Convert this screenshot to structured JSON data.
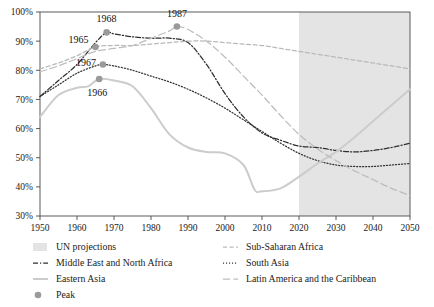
{
  "chart_data": {
    "type": "line",
    "title": "",
    "subtitle": "",
    "xlabel": "",
    "ylabel": "",
    "xlim": [
      1950,
      2050
    ],
    "ylim": [
      30,
      100
    ],
    "xticks": [
      1950,
      1960,
      1970,
      1980,
      1990,
      2000,
      2010,
      2020,
      2030,
      2040,
      2050
    ],
    "xtick_labels": [
      "1950",
      "1960",
      "1970",
      "1980",
      "1990",
      "2000",
      "2010",
      "2020",
      "2030",
      "2040",
      "2050"
    ],
    "yticks": [
      30,
      40,
      50,
      60,
      70,
      80,
      90,
      100
    ],
    "ytick_labels": [
      "30%",
      "40%",
      "50%",
      "60%",
      "70%",
      "80%",
      "90%",
      "100%"
    ],
    "grid": false,
    "legend_position": "below",
    "projection_band": {
      "label": "UN projections",
      "start": 2020,
      "end": 2050,
      "color": "#e4e4e4"
    },
    "series": [
      {
        "name": "Middle East and North Africa",
        "style": "dash-dot",
        "color": "#2f2f2f",
        "x": [
          1950,
          1955,
          1960,
          1965,
          1968,
          1970,
          1975,
          1980,
          1985,
          1990,
          1995,
          2000,
          2005,
          2010,
          2015,
          2020,
          2025,
          2030,
          2035,
          2040,
          2045,
          2050
        ],
        "values": [
          71.0,
          76.5,
          82.0,
          89.5,
          93.0,
          92.5,
          91.5,
          91.0,
          91.0,
          89.5,
          82.0,
          72.0,
          64.0,
          58.5,
          56.0,
          54.0,
          53.5,
          52.5,
          52.0,
          52.5,
          53.5,
          55.0
        ]
      },
      {
        "name": "Sub-Saharan Africa",
        "style": "dashed",
        "color": "#b9b9b9",
        "x": [
          1950,
          1955,
          1960,
          1965,
          1970,
          1975,
          1980,
          1985,
          1990,
          1995,
          2000,
          2005,
          2010,
          2015,
          2020,
          2025,
          2030,
          2035,
          2040,
          2045,
          2050
        ],
        "values": [
          80.5,
          82.5,
          85.0,
          88.0,
          88.5,
          88.5,
          89.0,
          89.5,
          90.0,
          90.0,
          89.5,
          89.0,
          88.5,
          87.5,
          86.5,
          85.5,
          84.5,
          83.5,
          82.5,
          81.5,
          80.5
        ]
      },
      {
        "name": "South Asia",
        "style": "dotted",
        "color": "#333333",
        "x": [
          1950,
          1955,
          1960,
          1965,
          1967,
          1970,
          1975,
          1980,
          1985,
          1990,
          1995,
          2000,
          2005,
          2010,
          2015,
          2020,
          2025,
          2030,
          2035,
          2040,
          2045,
          2050
        ],
        "values": [
          71.0,
          75.0,
          79.0,
          81.5,
          82.0,
          81.5,
          80.0,
          78.0,
          76.0,
          73.5,
          70.5,
          67.0,
          63.0,
          59.0,
          55.0,
          51.5,
          49.0,
          47.5,
          47.0,
          47.0,
          47.5,
          48.0
        ]
      },
      {
        "name": "Eastern Asia",
        "style": "solid",
        "color": "#cccccc",
        "x": [
          1950,
          1955,
          1960,
          1963,
          1966,
          1970,
          1975,
          1980,
          1985,
          1990,
          1995,
          2000,
          2005,
          2008,
          2010,
          2015,
          2020,
          2025,
          2030,
          2035,
          2040,
          2045,
          2050
        ],
        "values": [
          64.0,
          71.5,
          74.0,
          74.5,
          77.0,
          76.5,
          74.5,
          67.0,
          58.0,
          53.5,
          52.0,
          51.5,
          47.5,
          39.0,
          38.5,
          39.5,
          43.5,
          48.0,
          52.0,
          57.0,
          62.5,
          68.0,
          73.5
        ]
      },
      {
        "name": "Latin America and the Caribbean",
        "style": "long-dash",
        "color": "#bdbdbd",
        "x": [
          1950,
          1955,
          1960,
          1965,
          1970,
          1975,
          1980,
          1985,
          1987,
          1990,
          1995,
          2000,
          2005,
          2010,
          2015,
          2020,
          2025,
          2030,
          2035,
          2040,
          2045,
          2050
        ],
        "values": [
          79.5,
          81.5,
          84.0,
          86.5,
          87.5,
          88.5,
          91.0,
          93.5,
          95.0,
          94.0,
          90.0,
          84.5,
          78.0,
          71.5,
          64.5,
          58.0,
          53.0,
          49.0,
          45.5,
          42.5,
          39.5,
          37.0
        ]
      }
    ],
    "peaks": [
      {
        "label": "1968",
        "series": "Middle East and North Africa",
        "x": 1968,
        "y": 93.0
      },
      {
        "label": "1965",
        "series": "Sub-Saharan Africa",
        "x": 1965,
        "y": 88.0
      },
      {
        "label": "1967",
        "series": "South Asia",
        "x": 1967,
        "y": 82.0
      },
      {
        "label": "1966",
        "series": "Eastern Asia",
        "x": 1966,
        "y": 77.0
      },
      {
        "label": "1987",
        "series": "Latin America and the Caribbean",
        "x": 1987,
        "y": 95.0
      }
    ],
    "peak_marker": {
      "label": "Peak",
      "color": "#9a9a9a"
    }
  },
  "legend": {
    "left_column": [
      {
        "label": "UN projections",
        "swatch": "band",
        "color": "#e4e4e4"
      },
      {
        "label": "Middle East and North Africa",
        "swatch": "dash-dot",
        "color": "#2f2f2f"
      },
      {
        "label": "Eastern Asia",
        "swatch": "solid",
        "color": "#cccccc"
      },
      {
        "label": "Peak",
        "swatch": "dot",
        "color": "#9a9a9a"
      }
    ],
    "right_column": [
      {
        "label": "Sub-Saharan Africa",
        "swatch": "dashed",
        "color": "#b9b9b9"
      },
      {
        "label": "South Asia",
        "swatch": "dotted",
        "color": "#333333"
      },
      {
        "label": "Latin America and the Caribbean",
        "swatch": "long-dash",
        "color": "#bdbdbd"
      }
    ]
  }
}
